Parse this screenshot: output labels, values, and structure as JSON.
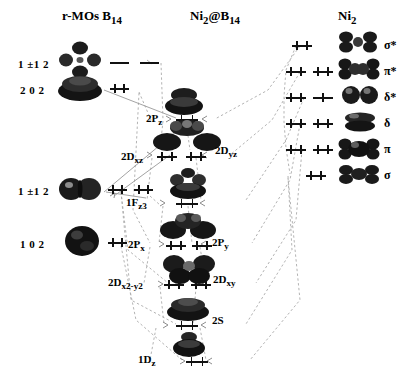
{
  "figure": {
    "type": "molecular-orbital-correlation-diagram",
    "headers": [
      {
        "id": "left",
        "label": "r-MOs B14",
        "text": "r-MOs B",
        "sub": "14"
      },
      {
        "id": "center",
        "label": "Ni2@B14",
        "text": "Ni",
        "sub": "2",
        "text2": "@B",
        "sub2": "14"
      },
      {
        "id": "right",
        "label": "Ni2",
        "text": "Ni",
        "sub": "2"
      }
    ]
  },
  "left_column": {
    "title": "r-MOs B14",
    "levels": [
      {
        "name": "1 ±1 2",
        "label": "1 ±1 2",
        "occupancy": "empty",
        "count": 2,
        "y": 62
      },
      {
        "name": "2 0 2",
        "label": "2 0 2",
        "occupancy": "pair",
        "count": 1,
        "y": 88
      },
      {
        "name": "1 ±1 2 lower",
        "label": "1 ±1 2",
        "occupancy": "pair",
        "count": 2,
        "y": 189
      },
      {
        "name": "1 0 2",
        "label": "1 0 2",
        "occupancy": "pair",
        "count": 1,
        "y": 241
      }
    ]
  },
  "center_column": {
    "title": "Ni2@B14",
    "levels": [
      {
        "label": "2P",
        "sub": "z",
        "occupancy": "pair",
        "count": 1,
        "y": 118
      },
      {
        "label": "2D",
        "sub": "xz",
        "occupancy": "pair",
        "count": 1,
        "y": 155
      },
      {
        "label": "2D",
        "sub": "yz",
        "occupancy": "pair",
        "count": 1,
        "y": 155
      },
      {
        "label": "1F",
        "sub": "z3",
        "occupancy": "pair",
        "count": 1,
        "y": 202
      },
      {
        "label": "2P",
        "sub": "x",
        "occupancy": "pair",
        "count": 1,
        "y": 243
      },
      {
        "label": "2P",
        "sub": "y",
        "occupancy": "pair",
        "count": 1,
        "y": 243
      },
      {
        "label": "2D",
        "sub": "x2-y2",
        "occupancy": "pair",
        "count": 1,
        "y": 283
      },
      {
        "label": "2D",
        "sub": "xy",
        "occupancy": "pair",
        "count": 1,
        "y": 283
      },
      {
        "label": "2S",
        "sub": "",
        "occupancy": "pair",
        "count": 1,
        "y": 324
      },
      {
        "label": "1D",
        "sub": "z",
        "occupancy": "pair",
        "count": 1,
        "y": 360
      }
    ]
  },
  "right_column": {
    "title": "Ni2",
    "levels": [
      {
        "symbol": "σ*",
        "occupancy": "pair",
        "count": 1,
        "y": 44
      },
      {
        "symbol": "π*",
        "occupancy": "pair",
        "count": 2,
        "y": 70
      },
      {
        "symbol": "δ*",
        "occupancy": "mixed",
        "count": 2,
        "y": 96
      },
      {
        "symbol": "δ",
        "occupancy": "pair",
        "count": 2,
        "y": 122
      },
      {
        "symbol": "π",
        "occupancy": "pair",
        "count": 2,
        "y": 148
      },
      {
        "symbol": "σ",
        "occupancy": "pair",
        "count": 1,
        "y": 174
      }
    ]
  },
  "colors": {
    "line": "#111111",
    "wire": "#a8a8a8",
    "lobe_dark": "#1a1a1a",
    "lobe_mid": "#4a4a4a",
    "background": "#ffffff"
  }
}
